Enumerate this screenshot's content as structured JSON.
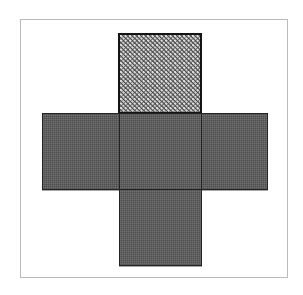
{
  "figure": {
    "description": "A plus-shaped arrangement of five equal squares inside a thin rectangular frame. The uppermost square is filled with a regular dot pattern; the other four squares are filled with plain grey.",
    "canvas": {
      "width": 303,
      "height": 295,
      "background": "#ffffff"
    },
    "frame": {
      "label": "Outer border",
      "x": 20,
      "y": 19,
      "width": 268,
      "height": 259,
      "stroke": "#55585c",
      "fill": "#ffffff"
    },
    "shape": {
      "name": "plus",
      "square_count": 5,
      "outline_color": "#232323"
    },
    "faces": [
      {
        "id": "top",
        "label": "Top square",
        "position": "top",
        "fill_style": "dotted",
        "fill_color": "#4d4d4d",
        "dot_color": "#e8e8e8",
        "x": 118,
        "y": 33,
        "width": 84,
        "height": 81
      },
      {
        "id": "left",
        "label": "Left square",
        "position": "left",
        "fill_style": "solid",
        "fill_color": "#5e5e5e",
        "x": 42,
        "y": 113,
        "width": 78,
        "height": 77
      },
      {
        "id": "center",
        "label": "Center square",
        "position": "center",
        "fill_style": "solid",
        "fill_color": "#5e5e5e",
        "x": 119,
        "y": 113,
        "width": 83,
        "height": 77
      },
      {
        "id": "right",
        "label": "Right square",
        "position": "right",
        "fill_style": "solid",
        "fill_color": "#5e5e5e",
        "x": 201,
        "y": 113,
        "width": 67,
        "height": 77
      },
      {
        "id": "bottom",
        "label": "Bottom square",
        "position": "bottom",
        "fill_style": "solid",
        "fill_color": "#5e5e5e",
        "x": 119,
        "y": 189,
        "width": 83,
        "height": 77
      }
    ]
  }
}
